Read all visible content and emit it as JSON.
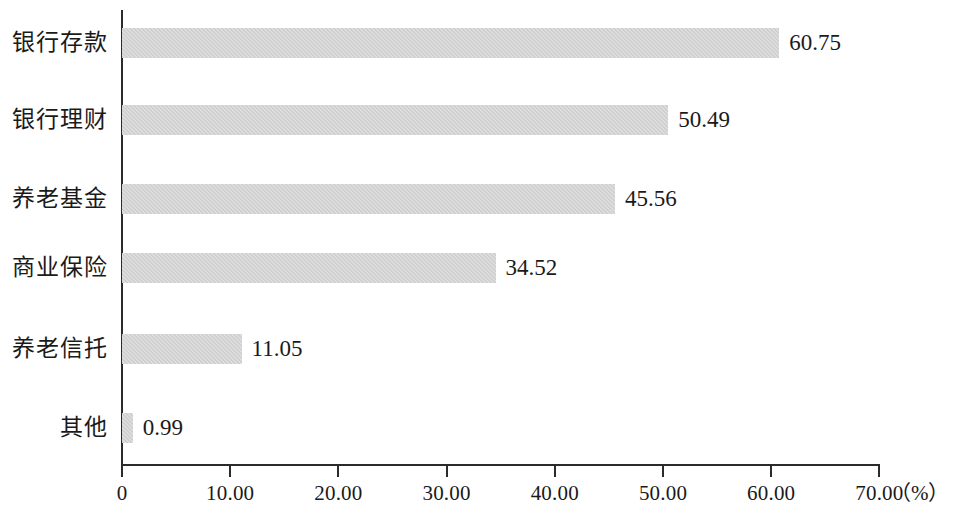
{
  "chart_data": {
    "type": "bar",
    "orientation": "horizontal",
    "title": "",
    "subtitle": "",
    "xlabel": "（%）",
    "ylabel": "",
    "categories": [
      "银行存款",
      "银行理财",
      "养老基金",
      "商业保险",
      "养老信托",
      "其他"
    ],
    "values": [
      60.75,
      50.49,
      45.56,
      34.52,
      11.05,
      0.99
    ],
    "value_labels": [
      "60.75",
      "50.49",
      "45.56",
      "34.52",
      "11.05",
      "0.99"
    ],
    "xlim": [
      0,
      70
    ],
    "xticks": [
      0,
      10,
      20,
      30,
      40,
      50,
      60,
      70
    ],
    "xtick_labels": [
      "0",
      "10.00",
      "20.00",
      "30.00",
      "40.00",
      "50.00",
      "60.00",
      "70.00"
    ],
    "grid": false,
    "legend": null,
    "series": [
      {
        "name": "占比",
        "values": [
          60.75,
          50.49,
          45.56,
          34.52,
          11.05,
          0.99
        ]
      }
    ],
    "bar_color": "#cfcfcf",
    "axis_color": "#2b2b2b",
    "text_color": "#1a1a1a"
  },
  "unit_annotation": "（%）"
}
